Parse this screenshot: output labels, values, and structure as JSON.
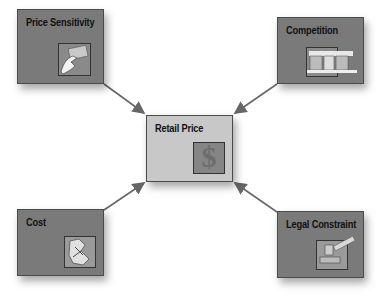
{
  "diagram": {
    "center": {
      "label": "Retail Price",
      "icon": "dollar-sign-icon"
    },
    "factors": [
      {
        "label": "Price Sensitivity",
        "icon": "hand-with-credit-card-icon",
        "position": "top-left"
      },
      {
        "label": "Competition",
        "icon": "storefront-icon",
        "position": "top-right"
      },
      {
        "label": "Cost",
        "icon": "worker-illustration-icon",
        "position": "bottom-left"
      },
      {
        "label": "Legal Constraint",
        "icon": "gavel-icon",
        "position": "bottom-right"
      }
    ],
    "colors": {
      "factor_box": "#7a7a7a",
      "center_box": "#c8c8c8",
      "arrow": "#666666",
      "text": "#111111"
    }
  }
}
